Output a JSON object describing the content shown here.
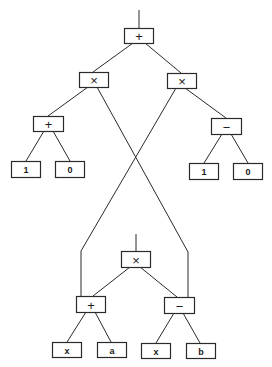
{
  "diagram": {
    "type": "expression-tree",
    "colors": {
      "stroke": "#2a2a2a",
      "background": "#ffffff",
      "text": "#1a1a1a"
    },
    "upper_tree": {
      "root": {
        "id": "u_root",
        "label": "+",
        "x": 124,
        "y": 28,
        "w": 29,
        "h": 15
      },
      "nodes": [
        {
          "id": "u_mul_left",
          "label": "×",
          "x": 79,
          "y": 72,
          "w": 29,
          "h": 15
        },
        {
          "id": "u_mul_right",
          "label": "×",
          "x": 167,
          "y": 73,
          "w": 29,
          "h": 15
        },
        {
          "id": "u_plus",
          "label": "+",
          "x": 33,
          "y": 116,
          "w": 30,
          "h": 15
        },
        {
          "id": "u_minus",
          "label": "−",
          "x": 211,
          "y": 118,
          "w": 30,
          "h": 16
        },
        {
          "id": "u_leaf_1a",
          "label": "1",
          "x": 11,
          "y": 161,
          "w": 29,
          "h": 16
        },
        {
          "id": "u_leaf_0a",
          "label": "0",
          "x": 55,
          "y": 161,
          "w": 29,
          "h": 16
        },
        {
          "id": "u_leaf_1b",
          "label": "1",
          "x": 189,
          "y": 163,
          "w": 29,
          "h": 16
        },
        {
          "id": "u_leaf_0b",
          "label": "0",
          "x": 233,
          "y": 163,
          "w": 29,
          "h": 16
        }
      ]
    },
    "lower_tree": {
      "root": {
        "id": "l_root",
        "label": "×",
        "x": 121,
        "y": 251,
        "w": 29,
        "h": 16
      },
      "nodes": [
        {
          "id": "l_plus",
          "label": "+",
          "x": 76,
          "y": 296,
          "w": 29,
          "h": 16
        },
        {
          "id": "l_minus",
          "label": "−",
          "x": 164,
          "y": 297,
          "w": 30,
          "h": 16
        },
        {
          "id": "l_leaf_x1",
          "label": "x",
          "x": 52,
          "y": 342,
          "w": 29,
          "h": 15
        },
        {
          "id": "l_leaf_a",
          "label": "a",
          "x": 97,
          "y": 342,
          "w": 29,
          "h": 15
        },
        {
          "id": "l_leaf_x2",
          "label": "x",
          "x": 141,
          "y": 343,
          "w": 29,
          "h": 15
        },
        {
          "id": "l_leaf_b",
          "label": "b",
          "x": 186,
          "y": 343,
          "w": 29,
          "h": 15
        }
      ]
    },
    "edges": [
      {
        "from": "top-stem",
        "points": [
          [
            139,
            10
          ],
          [
            139,
            28
          ]
        ]
      },
      {
        "from": "u_root",
        "to": "u_mul_left",
        "points": [
          [
            133,
            43
          ],
          [
            93,
            72
          ]
        ]
      },
      {
        "from": "u_root",
        "to": "u_mul_right",
        "points": [
          [
            145,
            43
          ],
          [
            181,
            73
          ]
        ]
      },
      {
        "from": "u_mul_left",
        "to": "u_plus",
        "points": [
          [
            88,
            87
          ],
          [
            48,
            116
          ]
        ]
      },
      {
        "from": "u_mul_right",
        "to": "u_minus",
        "points": [
          [
            185,
            88
          ],
          [
            226,
            118
          ]
        ]
      },
      {
        "from": "u_plus",
        "to": "u_leaf_1a",
        "points": [
          [
            44,
            131
          ],
          [
            26,
            161
          ]
        ]
      },
      {
        "from": "u_plus",
        "to": "u_leaf_0a",
        "points": [
          [
            53,
            131
          ],
          [
            70,
            161
          ]
        ]
      },
      {
        "from": "u_minus",
        "to": "u_leaf_1b",
        "points": [
          [
            222,
            134
          ],
          [
            204,
            163
          ]
        ]
      },
      {
        "from": "u_minus",
        "to": "u_leaf_0b",
        "points": [
          [
            231,
            134
          ],
          [
            248,
            163
          ]
        ]
      },
      {
        "from": "u_mul_left",
        "to": "l_minus",
        "points": [
          [
            97,
            87
          ],
          [
            188,
            252
          ],
          [
            188,
            297
          ]
        ]
      },
      {
        "from": "u_mul_right",
        "to": "l_plus",
        "points": [
          [
            176,
            88
          ],
          [
            81,
            251
          ],
          [
            81,
            296
          ]
        ]
      },
      {
        "from": "lower-stem",
        "points": [
          [
            136,
            234
          ],
          [
            136,
            251
          ]
        ]
      },
      {
        "from": "l_root",
        "to": "l_plus",
        "points": [
          [
            130,
            267
          ],
          [
            93,
            296
          ]
        ]
      },
      {
        "from": "l_root",
        "to": "l_minus",
        "points": [
          [
            140,
            267
          ],
          [
            177,
            297
          ]
        ]
      },
      {
        "from": "l_plus",
        "to": "l_leaf_x1",
        "points": [
          [
            86,
            312
          ],
          [
            67,
            342
          ]
        ]
      },
      {
        "from": "l_plus",
        "to": "l_leaf_a",
        "points": [
          [
            95,
            312
          ],
          [
            111,
            342
          ]
        ]
      },
      {
        "from": "l_minus",
        "to": "l_leaf_x2",
        "points": [
          [
            174,
            313
          ],
          [
            156,
            343
          ]
        ]
      },
      {
        "from": "l_minus",
        "to": "l_leaf_b",
        "points": [
          [
            183,
            313
          ],
          [
            200,
            343
          ]
        ]
      }
    ]
  }
}
